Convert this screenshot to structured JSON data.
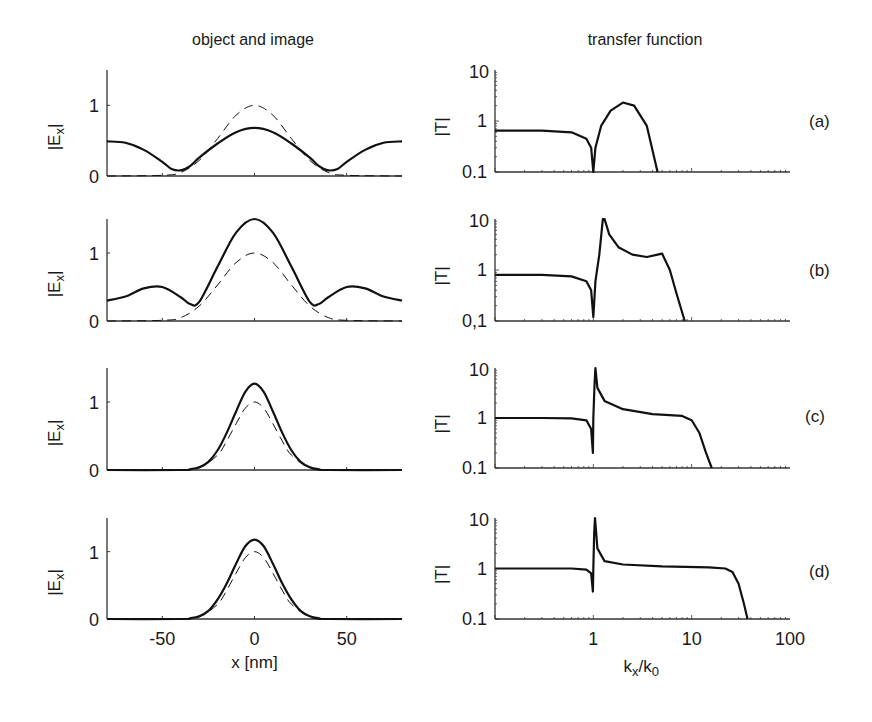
{
  "figure": {
    "left_column_title": "object and image",
    "right_column_title": "transfer function",
    "left_ylabel": "|E_x|",
    "right_ylabel": "|T|",
    "left_xlabel": "x [nm]",
    "right_xlabel": "k_x/k_0",
    "panel_labels": [
      "(a)",
      "(b)",
      "(c)",
      "(d)"
    ],
    "left_xticks": [
      "-50",
      "0",
      "50"
    ],
    "left_yticks": [
      "0",
      "1"
    ],
    "right_xticks": [
      "1",
      "10",
      "100"
    ],
    "right_yticks": [
      [
        "0.1",
        "1",
        "10"
      ],
      [
        "0,1",
        "1",
        "10"
      ],
      [
        "0.1",
        "1",
        "10"
      ],
      [
        "0.1",
        "1",
        "10"
      ]
    ]
  },
  "chart_data": [
    {
      "type": "line",
      "panel": "(a)",
      "title": "object and image",
      "xlabel": "x [nm]",
      "ylabel": "|E_x|",
      "xlim": [
        -80,
        80
      ],
      "ylim": [
        0,
        1.5
      ],
      "series": [
        {
          "name": "image (solid)",
          "style": "solid",
          "x": [
            -80,
            -70,
            -60,
            -50,
            -45,
            -40,
            -35,
            -30,
            -20,
            -10,
            0,
            10,
            20,
            30,
            35,
            40,
            45,
            50,
            60,
            70,
            80
          ],
          "y": [
            0.49,
            0.47,
            0.37,
            0.2,
            0.1,
            0.08,
            0.14,
            0.26,
            0.46,
            0.62,
            0.68,
            0.62,
            0.46,
            0.26,
            0.14,
            0.08,
            0.1,
            0.2,
            0.37,
            0.47,
            0.49
          ]
        },
        {
          "name": "object (dashed)",
          "style": "dashed",
          "x": [
            -80,
            -50,
            -40,
            -30,
            -20,
            -10,
            0,
            10,
            20,
            30,
            40,
            50,
            80
          ],
          "y": [
            0,
            0.01,
            0.05,
            0.22,
            0.53,
            0.86,
            1.0,
            0.86,
            0.53,
            0.22,
            0.05,
            0.01,
            0
          ]
        }
      ]
    },
    {
      "type": "line",
      "panel": "(a)",
      "title": "transfer function",
      "xlabel": "k_x/k_0",
      "ylabel": "|T|",
      "xscale": "log",
      "yscale": "log",
      "xlim": [
        0.1,
        100
      ],
      "ylim": [
        0.1,
        10
      ],
      "series": [
        {
          "name": "|T|",
          "style": "solid",
          "x": [
            0.1,
            0.3,
            0.6,
            0.85,
            0.95,
            1.0,
            1.05,
            1.2,
            1.5,
            2.0,
            2.6,
            3.5,
            4.5
          ],
          "y": [
            0.65,
            0.65,
            0.6,
            0.45,
            0.3,
            0.1,
            0.3,
            0.8,
            1.6,
            2.3,
            2.0,
            0.8,
            0.1
          ]
        }
      ]
    },
    {
      "type": "line",
      "panel": "(b)",
      "title": "object and image",
      "xlabel": "x [nm]",
      "ylabel": "|E_x|",
      "xlim": [
        -80,
        80
      ],
      "ylim": [
        0,
        1.5
      ],
      "series": [
        {
          "name": "image (solid)",
          "style": "solid",
          "x": [
            -80,
            -70,
            -60,
            -50,
            -40,
            -35,
            -30,
            -20,
            -10,
            0,
            10,
            20,
            30,
            35,
            40,
            50,
            60,
            70,
            80
          ],
          "y": [
            0.3,
            0.36,
            0.48,
            0.5,
            0.35,
            0.25,
            0.28,
            0.8,
            1.3,
            1.5,
            1.3,
            0.8,
            0.28,
            0.25,
            0.35,
            0.5,
            0.48,
            0.36,
            0.3
          ]
        },
        {
          "name": "object (dashed)",
          "style": "dashed",
          "x": [
            -80,
            -50,
            -40,
            -30,
            -20,
            -10,
            0,
            10,
            20,
            30,
            40,
            50,
            80
          ],
          "y": [
            0,
            0.01,
            0.05,
            0.22,
            0.53,
            0.86,
            1.0,
            0.86,
            0.53,
            0.22,
            0.05,
            0.01,
            0
          ]
        }
      ]
    },
    {
      "type": "line",
      "panel": "(b)",
      "title": "transfer function",
      "xlabel": "k_x/k_0",
      "ylabel": "|T|",
      "xscale": "log",
      "yscale": "log",
      "xlim": [
        0.1,
        100
      ],
      "ylim": [
        0.1,
        10
      ],
      "series": [
        {
          "name": "|T|",
          "style": "solid",
          "x": [
            0.1,
            0.3,
            0.6,
            0.85,
            0.95,
            1.0,
            1.05,
            1.15,
            1.25,
            1.3,
            1.45,
            1.8,
            2.5,
            3.5,
            4.5,
            5.0,
            6.0,
            7.0,
            8.5
          ],
          "y": [
            0.8,
            0.8,
            0.75,
            0.6,
            0.4,
            0.12,
            0.6,
            2.0,
            10,
            10,
            5.0,
            2.8,
            2.0,
            1.8,
            2.0,
            2.1,
            1.0,
            0.35,
            0.1
          ]
        }
      ]
    },
    {
      "type": "line",
      "panel": "(c)",
      "title": "object and image",
      "xlabel": "x [nm]",
      "ylabel": "|E_x|",
      "xlim": [
        -80,
        80
      ],
      "ylim": [
        0,
        1.5
      ],
      "series": [
        {
          "name": "image (solid)",
          "style": "solid",
          "x": [
            -80,
            -40,
            -35,
            -30,
            -25,
            -20,
            -15,
            -10,
            -5,
            0,
            5,
            10,
            15,
            20,
            25,
            30,
            35,
            40,
            80
          ],
          "y": [
            0,
            0,
            0.01,
            0.04,
            0.12,
            0.29,
            0.55,
            0.86,
            1.15,
            1.27,
            1.15,
            0.86,
            0.55,
            0.29,
            0.12,
            0.04,
            0.01,
            0,
            0
          ]
        },
        {
          "name": "object (dashed)",
          "style": "dashed",
          "x": [
            -80,
            -40,
            -30,
            -20,
            -15,
            -10,
            -5,
            0,
            5,
            10,
            15,
            20,
            30,
            40,
            80
          ],
          "y": [
            0,
            0,
            0.03,
            0.22,
            0.43,
            0.68,
            0.91,
            1.0,
            0.91,
            0.68,
            0.43,
            0.22,
            0.03,
            0,
            0
          ]
        }
      ]
    },
    {
      "type": "line",
      "panel": "(c)",
      "title": "transfer function",
      "xlabel": "k_x/k_0",
      "ylabel": "|T|",
      "xscale": "log",
      "yscale": "log",
      "xlim": [
        0.1,
        100
      ],
      "ylim": [
        0.1,
        10
      ],
      "series": [
        {
          "name": "|T|",
          "style": "solid",
          "x": [
            0.1,
            0.3,
            0.6,
            0.85,
            0.95,
            0.99,
            1.0,
            1.03,
            1.05,
            1.1,
            1.3,
            2.0,
            4.0,
            8.0,
            10,
            12,
            14,
            16
          ],
          "y": [
            1.0,
            1.0,
            0.98,
            0.9,
            0.6,
            0.2,
            1.0,
            5.0,
            10,
            4.0,
            2.2,
            1.5,
            1.2,
            1.1,
            0.9,
            0.5,
            0.2,
            0.1
          ]
        }
      ]
    },
    {
      "type": "line",
      "panel": "(d)",
      "title": "object and image",
      "xlabel": "x [nm]",
      "ylabel": "|E_x|",
      "xlim": [
        -80,
        80
      ],
      "ylim": [
        0,
        1.5
      ],
      "xticks": [
        -50,
        0,
        50
      ],
      "series": [
        {
          "name": "image (solid)",
          "style": "solid",
          "x": [
            -80,
            -40,
            -35,
            -30,
            -25,
            -20,
            -15,
            -10,
            -5,
            0,
            5,
            10,
            15,
            20,
            25,
            30,
            35,
            40,
            80
          ],
          "y": [
            0,
            0,
            0.01,
            0.04,
            0.12,
            0.29,
            0.53,
            0.82,
            1.08,
            1.18,
            1.08,
            0.82,
            0.53,
            0.29,
            0.12,
            0.04,
            0.01,
            0,
            0
          ]
        },
        {
          "name": "object (dashed)",
          "style": "dashed",
          "x": [
            -80,
            -40,
            -30,
            -20,
            -15,
            -10,
            -5,
            0,
            5,
            10,
            15,
            20,
            30,
            40,
            80
          ],
          "y": [
            0,
            0,
            0.03,
            0.22,
            0.43,
            0.68,
            0.91,
            1.0,
            0.91,
            0.68,
            0.43,
            0.22,
            0.03,
            0,
            0
          ]
        }
      ]
    },
    {
      "type": "line",
      "panel": "(d)",
      "title": "transfer function",
      "xlabel": "k_x/k_0",
      "ylabel": "|T|",
      "xscale": "log",
      "yscale": "log",
      "xlim": [
        0.1,
        100
      ],
      "ylim": [
        0.1,
        10
      ],
      "xticks": [
        1,
        10,
        100
      ],
      "series": [
        {
          "name": "|T|",
          "style": "solid",
          "x": [
            0.1,
            0.3,
            0.6,
            0.85,
            0.95,
            0.99,
            1.0,
            1.02,
            1.04,
            1.1,
            1.3,
            2.0,
            5.0,
            15,
            22,
            26,
            30,
            34,
            37
          ],
          "y": [
            1.0,
            1.0,
            1.0,
            0.95,
            0.8,
            0.35,
            1.0,
            5.0,
            10,
            2.5,
            1.4,
            1.2,
            1.1,
            1.05,
            1.0,
            0.85,
            0.5,
            0.2,
            0.1
          ]
        }
      ]
    }
  ]
}
